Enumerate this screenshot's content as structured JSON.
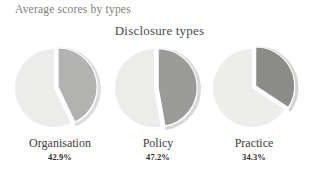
{
  "header": {
    "text": "Average scores by types"
  },
  "chart_data": {
    "type": "pie",
    "title": "Disclosure types",
    "subtitle": "",
    "xlabel": "",
    "ylabel": "",
    "legend": "none",
    "grid": false,
    "note": "Three separate single-value pie charts; each shows the average score as a percentage with the scored portion exploded away from the remainder.",
    "categories": [
      "Organisation",
      "Policy",
      "Practice"
    ],
    "values": [
      42.9,
      47.2,
      34.3
    ],
    "value_labels": [
      "42.9%",
      "47.2%",
      "34.3%"
    ],
    "units": "%",
    "charts": [
      {
        "label": "Organisation",
        "value": 42.9,
        "value_label": "42.9%",
        "remainder": 57.1,
        "slice_color": "#b2b2b0",
        "remainder_color": "#ececeb",
        "shadow_color": "#dcdcda"
      },
      {
        "label": "Policy",
        "value": 47.2,
        "value_label": "47.2%",
        "remainder": 52.8,
        "slice_color": "#9b9b99",
        "remainder_color": "#ececea",
        "shadow_color": "#d8d8d6"
      },
      {
        "label": "Practice",
        "value": 34.3,
        "value_label": "34.3%",
        "remainder": 65.7,
        "slice_color": "#8b8b89",
        "remainder_color": "#ededec",
        "shadow_color": "#d4d4d2"
      }
    ]
  },
  "colors": {
    "background": "#ffffff",
    "header_text": "#7d7d7d",
    "title_text": "#4a4a4a",
    "label_text": "#3c3c3c",
    "value_text": "#2e2e2e"
  }
}
